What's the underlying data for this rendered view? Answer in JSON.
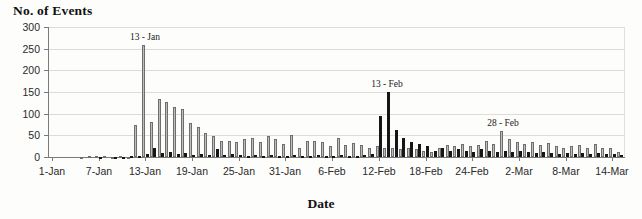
{
  "chart_data": {
    "type": "bar",
    "title": "No. of Events",
    "xlabel": "Date",
    "ylabel": "No. of Events",
    "ylim": [
      0,
      300
    ],
    "yticks": [
      0,
      50,
      100,
      150,
      200,
      250,
      300
    ],
    "grid": true,
    "legend": "none",
    "x_tick_labels": [
      "1-Jan",
      "7-Jan",
      "13-Jan",
      "19-Jan",
      "25-Jan",
      "31-Jan",
      "6-Feb",
      "12-Feb",
      "18-Feb",
      "24-Feb",
      "2-Mar",
      "8-Mar",
      "14-Mar"
    ],
    "x_tick_day_indices": [
      0,
      6,
      12,
      18,
      24,
      30,
      36,
      42,
      48,
      54,
      60,
      66,
      72
    ],
    "categories": [
      "1-Jan",
      "2-Jan",
      "3-Jan",
      "4-Jan",
      "5-Jan",
      "6-Jan",
      "7-Jan",
      "8-Jan",
      "9-Jan",
      "10-Jan",
      "11-Jan",
      "12-Jan",
      "13-Jan",
      "14-Jan",
      "15-Jan",
      "16-Jan",
      "17-Jan",
      "18-Jan",
      "19-Jan",
      "20-Jan",
      "21-Jan",
      "22-Jan",
      "23-Jan",
      "24-Jan",
      "25-Jan",
      "26-Jan",
      "27-Jan",
      "28-Jan",
      "29-Jan",
      "30-Jan",
      "31-Jan",
      "1-Feb",
      "2-Feb",
      "3-Feb",
      "4-Feb",
      "5-Feb",
      "6-Feb",
      "7-Feb",
      "8-Feb",
      "9-Feb",
      "10-Feb",
      "11-Feb",
      "12-Feb",
      "13-Feb",
      "14-Feb",
      "15-Feb",
      "16-Feb",
      "17-Feb",
      "18-Feb",
      "19-Feb",
      "20-Feb",
      "21-Feb",
      "22-Feb",
      "23-Feb",
      "24-Feb",
      "25-Feb",
      "26-Feb",
      "27-Feb",
      "28-Feb",
      "1-Mar",
      "2-Mar",
      "3-Mar",
      "4-Mar",
      "5-Mar",
      "6-Mar",
      "7-Mar",
      "8-Mar",
      "9-Mar",
      "10-Mar",
      "11-Mar",
      "12-Mar",
      "13-Mar",
      "14-Mar",
      "15-Mar"
    ],
    "series": [
      {
        "name": "gray-events",
        "color": "#bdbdbd",
        "values": [
          0,
          0,
          0,
          0,
          1,
          2,
          3,
          2,
          1,
          2,
          1,
          75,
          258,
          80,
          135,
          127,
          115,
          111,
          78,
          69,
          55,
          48,
          38,
          38,
          35,
          42,
          45,
          35,
          48,
          42,
          30,
          50,
          22,
          38,
          38,
          35,
          25,
          45,
          28,
          32,
          28,
          22,
          25,
          22,
          20,
          18,
          20,
          18,
          15,
          12,
          22,
          28,
          25,
          30,
          25,
          28,
          38,
          30,
          60,
          42,
          35,
          30,
          35,
          28,
          32,
          25,
          22,
          25,
          28,
          22,
          30,
          22,
          20,
          12
        ]
      },
      {
        "name": "black-events",
        "color": "#161616",
        "values": [
          0,
          0,
          0,
          0,
          0,
          0,
          1,
          0,
          1,
          1,
          2,
          2,
          6,
          20,
          10,
          12,
          8,
          10,
          5,
          8,
          5,
          18,
          4,
          6,
          5,
          3,
          4,
          3,
          4,
          3,
          3,
          4,
          2,
          3,
          4,
          3,
          3,
          4,
          3,
          3,
          4,
          8,
          95,
          150,
          63,
          45,
          35,
          30,
          25,
          15,
          20,
          15,
          18,
          15,
          12,
          18,
          15,
          12,
          15,
          12,
          15,
          12,
          10,
          12,
          10,
          8,
          10,
          8,
          10,
          8,
          10,
          8,
          8,
          5
        ]
      }
    ],
    "annotations": [
      {
        "label": "13 - Jan",
        "day_index": 12,
        "series": 0
      },
      {
        "label": "13 - Feb",
        "day_index": 43,
        "series": 1
      },
      {
        "label": "28 - Feb",
        "day_index": 58,
        "series": 0
      }
    ],
    "colors": {
      "gray_bar": "#bdbdbd",
      "black_bar": "#161616",
      "gridline": "#dcdcd8",
      "axis": "#7a7a7a",
      "text": "#1a1a1a",
      "background": "#fdfdfc"
    }
  }
}
